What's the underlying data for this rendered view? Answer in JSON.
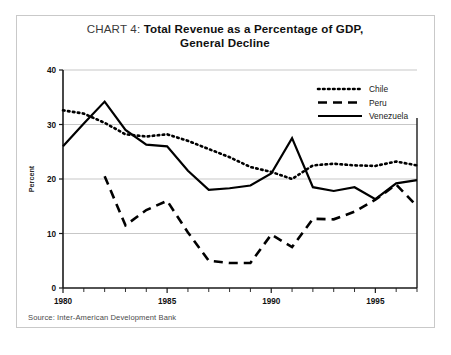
{
  "title": {
    "prefix": "CHART 4: ",
    "line1": "Total Revenue as a Percentage of GDP,",
    "line2": "General Decline"
  },
  "source": {
    "text": "Source: Inter-American Development Bank"
  },
  "axis": {
    "ylabel": "Percent",
    "yticks": [
      "0",
      "10",
      "20",
      "30",
      "40"
    ],
    "xticks": [
      "1980",
      "1985",
      "1990",
      "1995"
    ]
  },
  "legend": {
    "items": [
      {
        "label": "Chile",
        "style": "dotted",
        "color": "#000000"
      },
      {
        "label": "Peru",
        "style": "dashed",
        "color": "#000000"
      },
      {
        "label": "Venezuela",
        "style": "solid",
        "color": "#000000"
      }
    ]
  },
  "chart_data": {
    "type": "line",
    "title": "CHART 4: Total Revenue as a Percentage of GDP, General Decline",
    "subtitle": "General Decline",
    "xlabel": "",
    "ylabel": "Percent",
    "xlim": [
      1980,
      1997
    ],
    "ylim": [
      0,
      40
    ],
    "yticks": [
      0,
      10,
      20,
      30,
      40
    ],
    "xticks": [
      1980,
      1985,
      1990,
      1995
    ],
    "grid": "horizontal",
    "legend_position": "top-right",
    "source": "Inter-American Development Bank",
    "x": [
      1980,
      1981,
      1982,
      1983,
      1984,
      1985,
      1986,
      1987,
      1988,
      1989,
      1990,
      1991,
      1992,
      1993,
      1994,
      1995,
      1996,
      1997
    ],
    "series": [
      {
        "name": "Chile",
        "style": "dotted",
        "x": [
          1980,
          1981,
          1982,
          1983,
          1984,
          1985,
          1986,
          1987,
          1988,
          1989,
          1990,
          1991,
          1992,
          1993,
          1994,
          1995,
          1996,
          1997
        ],
        "values": [
          32.6,
          32.0,
          30.3,
          28.2,
          27.8,
          28.2,
          27.0,
          25.5,
          24.0,
          22.2,
          21.3,
          20.0,
          22.5,
          22.8,
          22.5,
          22.4,
          23.2,
          22.5
        ]
      },
      {
        "name": "Peru",
        "style": "dashed",
        "x": [
          1982,
          1983,
          1984,
          1985,
          1986,
          1987,
          1988,
          1989,
          1990,
          1991,
          1992,
          1993,
          1994,
          1995,
          1996,
          1997
        ],
        "values": [
          20.5,
          11.5,
          14.3,
          16.0,
          10.2,
          5.0,
          4.6,
          4.6,
          9.8,
          7.5,
          12.7,
          12.6,
          14.0,
          16.2,
          19.0,
          15.0
        ]
      },
      {
        "name": "Venezuela",
        "style": "solid",
        "x": [
          1980,
          1981,
          1982,
          1983,
          1984,
          1985,
          1986,
          1987,
          1988,
          1989,
          1990,
          1991,
          1992,
          1993,
          1994,
          1995,
          1996,
          1997
        ],
        "values": [
          26.0,
          30.2,
          34.2,
          29.0,
          26.3,
          26.0,
          21.5,
          18.0,
          18.3,
          18.8,
          21.0,
          27.5,
          18.5,
          17.8,
          18.5,
          16.3,
          19.2,
          19.8
        ]
      }
    ]
  }
}
